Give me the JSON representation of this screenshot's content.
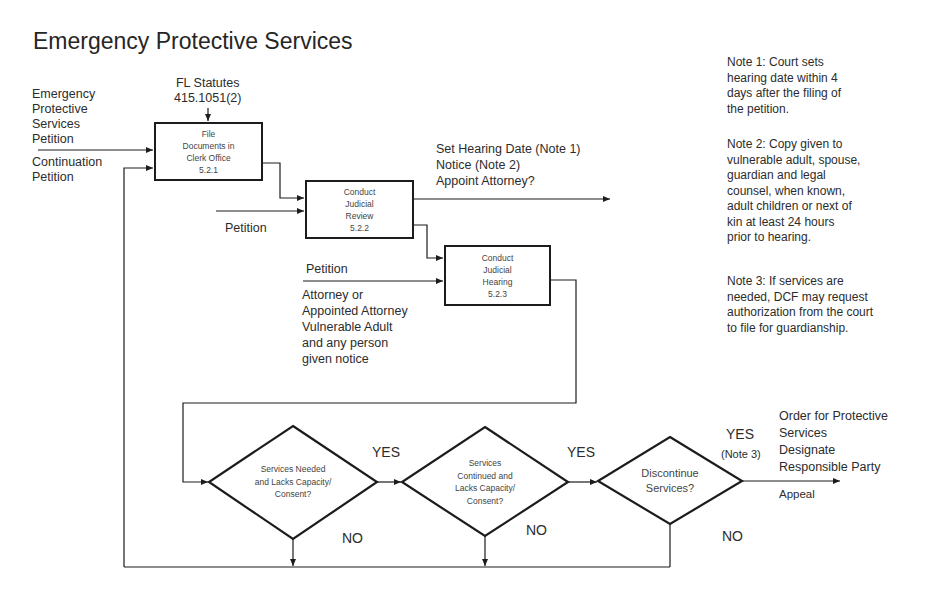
{
  "title": "Emergency Protective Services",
  "inputs": {
    "statutes": [
      "FL Statutes",
      "415.1051(2)"
    ],
    "eps_petition": [
      "Emergency",
      "Protective",
      "Services",
      "Petition"
    ],
    "continuation_petition": [
      "Continuation",
      "Petition"
    ],
    "review_petition": "Petition",
    "hearing_petition": "Petition",
    "hearing_parties": [
      "Attorney or",
      "Appointed Attorney",
      "Vulnerable Adult",
      "and any person",
      "given notice"
    ]
  },
  "processes": [
    {
      "id": "5.2.1",
      "lines": [
        "File",
        "Documents in",
        "Clerk Office",
        "5.2.1"
      ]
    },
    {
      "id": "5.2.2",
      "lines": [
        "Conduct",
        "Judicial",
        "Review",
        "5.2.2"
      ]
    },
    {
      "id": "5.2.3",
      "lines": [
        "Conduct",
        "Judicial",
        "Hearing",
        "5.2.3"
      ]
    }
  ],
  "review_outputs": [
    "Set Hearing Date (Note 1)",
    "Notice (Note 2)",
    "Appoint Attorney?"
  ],
  "decisions": [
    {
      "lines": [
        "Services Needed",
        "and Lacks Capacity/",
        "Consent?"
      ],
      "yes": "YES",
      "no": "NO"
    },
    {
      "lines": [
        "Services",
        "Continued and",
        "Lacks Capacity/",
        "Consent?"
      ],
      "yes": "YES",
      "no": "NO"
    },
    {
      "lines": [
        "Discontinue",
        "Services?"
      ],
      "yes": "YES",
      "yes_note": "(Note 3)",
      "no": "NO"
    }
  ],
  "final_outputs": {
    "lines": [
      "Order for Protective",
      "Services",
      "Designate",
      "Responsible Party"
    ],
    "appeal": "Appeal"
  },
  "notes": [
    [
      "Note 1:  Court sets",
      "hearing date within 4",
      "days after the filing of",
      "the petition."
    ],
    [
      "Note 2:  Copy given to",
      "vulnerable adult, spouse,",
      "guardian and legal",
      "counsel, when known,",
      "adult children or next of",
      "kin at least 24 hours",
      "prior to hearing."
    ],
    [
      "Note 3:  If services are",
      "needed, DCF may request",
      "authorization from the court",
      "to file for guardianship."
    ]
  ],
  "colors": {
    "line": "#1c1c1c",
    "text": "#2c2c2c"
  }
}
